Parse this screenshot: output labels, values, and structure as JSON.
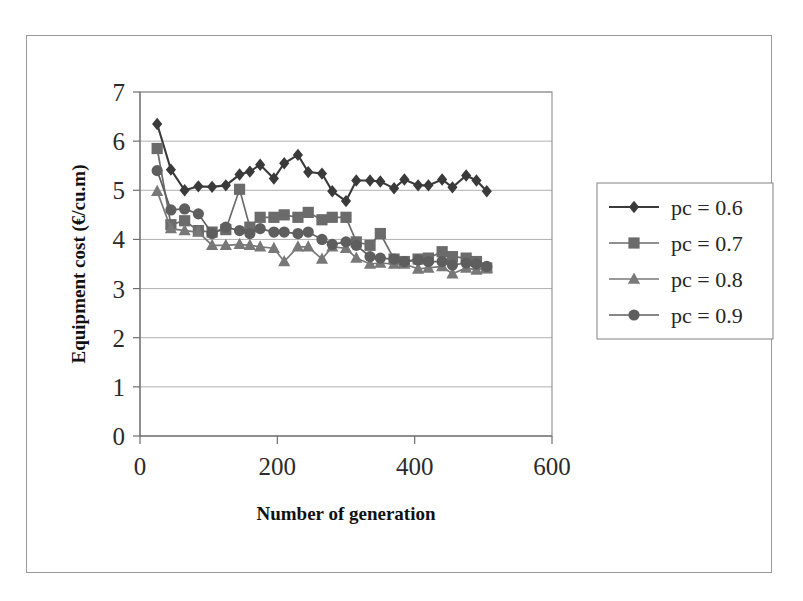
{
  "figure": {
    "background_color": "#ffffff",
    "frame_color": "#9a9a9a",
    "plot_border_color": "#8d8d8d",
    "gridline_color": "#b0b0b0"
  },
  "chart_data": {
    "type": "line",
    "title": "",
    "xlabel": "Number of generation",
    "ylabel": "Equipment cost (€/cu.m)",
    "xlim": [
      0,
      600
    ],
    "ylim": [
      0,
      7
    ],
    "xticks": [
      "0",
      "200",
      "400",
      "600"
    ],
    "xtick_values": [
      0,
      200,
      400,
      600
    ],
    "yticks": [
      "0",
      "1",
      "2",
      "3",
      "4",
      "5",
      "6",
      "7"
    ],
    "ytick_values": [
      0,
      1,
      2,
      3,
      4,
      5,
      6,
      7
    ],
    "grid": "horizontal",
    "legend_position": "right-outside",
    "markers": [
      "diamond",
      "square",
      "triangle",
      "circle"
    ],
    "colors": [
      "#3a3a3a",
      "#6b6b6b",
      "#787878",
      "#5e5e5e"
    ],
    "x": [
      25,
      45,
      65,
      85,
      105,
      125,
      145,
      160,
      175,
      195,
      210,
      230,
      245,
      265,
      280,
      300,
      315,
      335,
      350,
      370,
      385,
      405,
      420,
      440,
      455,
      475,
      490,
      505
    ],
    "series": [
      {
        "name": "pc = 0.6",
        "marker": "diamond",
        "color": "#3a3a3a",
        "values": [
          6.35,
          5.42,
          5.0,
          5.08,
          5.07,
          5.1,
          5.32,
          5.38,
          5.52,
          5.24,
          5.55,
          5.72,
          5.37,
          5.34,
          4.98,
          4.78,
          5.2,
          5.2,
          5.18,
          5.04,
          5.22,
          5.1,
          5.1,
          5.22,
          5.06,
          5.3,
          5.2,
          4.98
        ]
      },
      {
        "name": "pc = 0.7",
        "marker": "square",
        "color": "#6b6b6b",
        "values": [
          5.85,
          4.3,
          4.38,
          4.18,
          4.15,
          4.2,
          5.02,
          4.25,
          4.45,
          4.45,
          4.5,
          4.45,
          4.55,
          4.4,
          4.45,
          4.45,
          3.95,
          3.88,
          4.12,
          3.6,
          3.55,
          3.6,
          3.62,
          3.75,
          3.65,
          3.62,
          3.55,
          3.42
        ]
      },
      {
        "name": "pc = 0.8",
        "marker": "triangle",
        "color": "#787878",
        "values": [
          4.98,
          4.22,
          4.18,
          4.15,
          3.88,
          3.88,
          3.9,
          3.88,
          3.85,
          3.82,
          3.55,
          3.85,
          3.85,
          3.6,
          3.85,
          3.82,
          3.62,
          3.5,
          3.52,
          3.5,
          3.5,
          3.4,
          3.42,
          3.45,
          3.3,
          3.42,
          3.38,
          3.42
        ]
      },
      {
        "name": "pc = 0.9",
        "marker": "circle",
        "color": "#5e5e5e",
        "values": [
          5.4,
          4.6,
          4.62,
          4.52,
          4.12,
          4.25,
          4.18,
          4.12,
          4.22,
          4.15,
          4.15,
          4.12,
          4.15,
          4.0,
          3.9,
          3.95,
          3.88,
          3.65,
          3.62,
          3.6,
          3.55,
          3.58,
          3.55,
          3.55,
          3.48,
          3.52,
          3.5,
          3.45
        ]
      }
    ],
    "legend_entries": [
      "pc = 0.6",
      "pc = 0.7",
      "pc = 0.8",
      "pc = 0.9"
    ]
  }
}
